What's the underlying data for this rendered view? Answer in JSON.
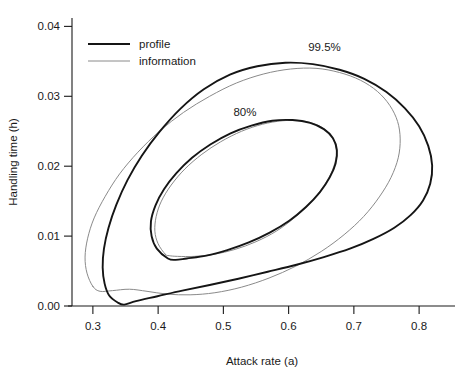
{
  "chart_data": {
    "type": "line",
    "title": "",
    "xlabel": "Attack rate (a)",
    "ylabel": "Handling time (h)",
    "xlim": [
      0.268,
      0.855
    ],
    "ylim": [
      0.0,
      0.0412
    ],
    "xticks": [
      0.3,
      0.4,
      0.5,
      0.6,
      0.7,
      0.8
    ],
    "xticklabels": [
      "0.3",
      "0.4",
      "0.5",
      "0.6",
      "0.7",
      "0.8"
    ],
    "yticks": [
      0.0,
      0.01,
      0.02,
      0.03,
      0.04
    ],
    "yticklabels": [
      "0.00",
      "0.01",
      "0.02",
      "0.03",
      "0.04"
    ],
    "grid": false,
    "legend_position": "top-left",
    "annotations": [
      {
        "text": "99.5%",
        "x": 0.655,
        "y": 0.0365
      },
      {
        "text": "80%",
        "x": 0.533,
        "y": 0.0272
      }
    ],
    "series": [
      {
        "name": "profile",
        "color": "#151515",
        "linewidth": 1.9,
        "contours": [
          {
            "level": "99.5%",
            "center": [
              0.558,
              0.0168
            ],
            "description": "profile-likelihood 99.5% confidence region, banana-shaped, elongated along positive a-h correlation",
            "points": [
              [
                0.338,
                0.0005
              ],
              [
                0.325,
                0.0015
              ],
              [
                0.318,
                0.0032
              ],
              [
                0.315,
                0.0055
              ],
              [
                0.317,
                0.0082
              ],
              [
                0.324,
                0.0112
              ],
              [
                0.336,
                0.0145
              ],
              [
                0.353,
                0.018
              ],
              [
                0.375,
                0.0215
              ],
              [
                0.402,
                0.0249
              ],
              [
                0.434,
                0.0282
              ],
              [
                0.47,
                0.031
              ],
              [
                0.51,
                0.0331
              ],
              [
                0.552,
                0.0343
              ],
              [
                0.595,
                0.0348
              ],
              [
                0.637,
                0.0346
              ],
              [
                0.678,
                0.0338
              ],
              [
                0.716,
                0.0325
              ],
              [
                0.75,
                0.0306
              ],
              [
                0.778,
                0.0283
              ],
              [
                0.8,
                0.0257
              ],
              [
                0.814,
                0.0229
              ],
              [
                0.82,
                0.0201
              ],
              [
                0.817,
                0.0175
              ],
              [
                0.806,
                0.0151
              ],
              [
                0.787,
                0.013
              ],
              [
                0.762,
                0.0112
              ],
              [
                0.73,
                0.0096
              ],
              [
                0.694,
                0.0082
              ],
              [
                0.654,
                0.007
              ],
              [
                0.612,
                0.0059
              ],
              [
                0.568,
                0.0049
              ],
              [
                0.523,
                0.0039
              ],
              [
                0.479,
                0.003
              ],
              [
                0.437,
                0.0022
              ],
              [
                0.399,
                0.0014
              ],
              [
                0.366,
                0.0007
              ],
              [
                0.348,
                0.0002
              ],
              [
                0.338,
                0.0005
              ]
            ]
          },
          {
            "level": "80%",
            "center": [
              0.525,
              0.017
            ],
            "description": "profile-likelihood 80% confidence region, inner ellipse",
            "points": [
              [
                0.415,
                0.0068
              ],
              [
                0.398,
                0.0082
              ],
              [
                0.39,
                0.01
              ],
              [
                0.389,
                0.0121
              ],
              [
                0.396,
                0.0144
              ],
              [
                0.409,
                0.0167
              ],
              [
                0.428,
                0.019
              ],
              [
                0.452,
                0.0212
              ],
              [
                0.48,
                0.0231
              ],
              [
                0.511,
                0.0247
              ],
              [
                0.543,
                0.0258
              ],
              [
                0.575,
                0.0265
              ],
              [
                0.606,
                0.0266
              ],
              [
                0.633,
                0.0262
              ],
              [
                0.654,
                0.0253
              ],
              [
                0.668,
                0.024
              ],
              [
                0.674,
                0.0223
              ],
              [
                0.672,
                0.0204
              ],
              [
                0.663,
                0.0184
              ],
              [
                0.648,
                0.0163
              ],
              [
                0.627,
                0.0142
              ],
              [
                0.601,
                0.0122
              ],
              [
                0.571,
                0.0105
              ],
              [
                0.539,
                0.0091
              ],
              [
                0.506,
                0.008
              ],
              [
                0.474,
                0.0072
              ],
              [
                0.444,
                0.0068
              ],
              [
                0.427,
                0.0066
              ],
              [
                0.415,
                0.0068
              ]
            ]
          }
        ]
      },
      {
        "name": "information",
        "color": "#8a8a8a",
        "linewidth": 1.0,
        "contours": [
          {
            "level": "99.5%",
            "center": [
              0.545,
              0.0168
            ],
            "description": "information-matrix (quadratic approximation) 99.5% confidence ellipse",
            "points": [
              [
                0.3,
                0.0028
              ],
              [
                0.291,
                0.0047
              ],
              [
                0.288,
                0.007
              ],
              [
                0.292,
                0.0097
              ],
              [
                0.302,
                0.0126
              ],
              [
                0.319,
                0.0157
              ],
              [
                0.341,
                0.0189
              ],
              [
                0.369,
                0.022
              ],
              [
                0.402,
                0.025
              ],
              [
                0.439,
                0.0277
              ],
              [
                0.479,
                0.03
              ],
              [
                0.52,
                0.0319
              ],
              [
                0.562,
                0.0332
              ],
              [
                0.603,
                0.0339
              ],
              [
                0.642,
                0.034
              ],
              [
                0.678,
                0.0334
              ],
              [
                0.71,
                0.0323
              ],
              [
                0.736,
                0.0307
              ],
              [
                0.755,
                0.0287
              ],
              [
                0.767,
                0.0264
              ],
              [
                0.771,
                0.0239
              ],
              [
                0.768,
                0.0212
              ],
              [
                0.757,
                0.0184
              ],
              [
                0.739,
                0.0156
              ],
              [
                0.715,
                0.0128
              ],
              [
                0.685,
                0.0102
              ],
              [
                0.65,
                0.0078
              ],
              [
                0.611,
                0.0057
              ],
              [
                0.57,
                0.004
              ],
              [
                0.528,
                0.0027
              ],
              [
                0.487,
                0.0019
              ],
              [
                0.449,
                0.0016
              ],
              [
                0.414,
                0.0017
              ],
              [
                0.383,
                0.0021
              ],
              [
                0.356,
                0.0024
              ],
              [
                0.33,
                0.0022
              ],
              [
                0.311,
                0.0021
              ],
              [
                0.3,
                0.0028
              ]
            ]
          },
          {
            "level": "80%",
            "center": [
              0.525,
              0.017
            ],
            "description": "information-matrix 80% confidence ellipse, inner",
            "points": [
              [
                0.411,
                0.0074
              ],
              [
                0.4,
                0.0089
              ],
              [
                0.395,
                0.0107
              ],
              [
                0.397,
                0.0128
              ],
              [
                0.405,
                0.015
              ],
              [
                0.42,
                0.0173
              ],
              [
                0.441,
                0.0196
              ],
              [
                0.467,
                0.0217
              ],
              [
                0.496,
                0.0235
              ],
              [
                0.528,
                0.025
              ],
              [
                0.56,
                0.026
              ],
              [
                0.591,
                0.0265
              ],
              [
                0.62,
                0.0265
              ],
              [
                0.644,
                0.0259
              ],
              [
                0.661,
                0.0248
              ],
              [
                0.671,
                0.0233
              ],
              [
                0.673,
                0.0215
              ],
              [
                0.667,
                0.0194
              ],
              [
                0.654,
                0.0172
              ],
              [
                0.635,
                0.0149
              ],
              [
                0.61,
                0.0127
              ],
              [
                0.581,
                0.0107
              ],
              [
                0.55,
                0.0092
              ],
              [
                0.518,
                0.0081
              ],
              [
                0.486,
                0.0074
              ],
              [
                0.456,
                0.0071
              ],
              [
                0.43,
                0.0071
              ],
              [
                0.417,
                0.0072
              ],
              [
                0.411,
                0.0074
              ]
            ]
          }
        ]
      }
    ],
    "legend": [
      {
        "label": "profile",
        "color": "#151515",
        "linewidth": 2.2
      },
      {
        "label": "information",
        "color": "#8a8a8a",
        "linewidth": 1.0
      }
    ]
  }
}
